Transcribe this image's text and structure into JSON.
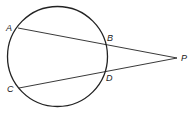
{
  "diagram": {
    "type": "geometry",
    "circle": {
      "cx": 57.5,
      "cy": 56.5,
      "r": 50,
      "stroke": "#222222"
    },
    "points": {
      "A": {
        "label": "A",
        "x": 18,
        "y": 28
      },
      "B": {
        "label": "B",
        "x": 106,
        "y": 43
      },
      "C": {
        "label": "C",
        "x": 19,
        "y": 88
      },
      "D": {
        "label": "D",
        "x": 106,
        "y": 70
      },
      "P": {
        "label": "P",
        "x": 177,
        "y": 58
      }
    },
    "segments": [
      {
        "name": "secant-APB",
        "from": "A",
        "to": "P"
      },
      {
        "name": "secant-CPD",
        "from": "C",
        "to": "P"
      }
    ],
    "labels": {
      "A": "A",
      "B": "B",
      "C": "C",
      "D": "D",
      "P": "P"
    }
  }
}
